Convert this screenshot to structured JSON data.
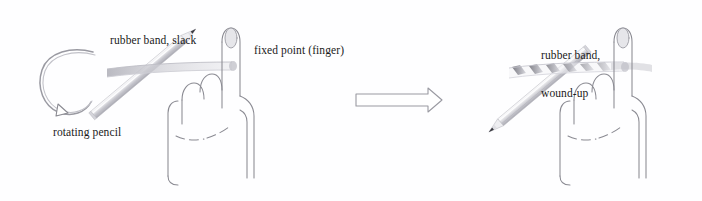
{
  "figure": {
    "background_color": "#fefeff",
    "width": 702,
    "height": 201
  },
  "panels": [
    {
      "id": "before",
      "name": "slack-state",
      "labels": {
        "band": "rubber band, slack",
        "fixed_point": "fixed point (finger)",
        "pencil": "rotating pencil"
      },
      "objects": {
        "pencil": "pencil-sharp-tip-upper-left",
        "hand": "fist-with-index-finger-extended",
        "band": "flat-untwisted-band",
        "rotation_arrow": "circular-arrow-counterclockwise"
      }
    },
    {
      "id": "after",
      "name": "wound-state",
      "labels": {
        "band_line1": "rubber band,",
        "band_line2": "wound-up"
      },
      "objects": {
        "pencil": "pencil-sharp-tip-lower-right",
        "hand": "fist-with-index-finger-extended",
        "band": "helically-twisted-band"
      }
    }
  ],
  "transition": {
    "name": "process-arrow",
    "direction": "right",
    "label": ""
  },
  "colors": {
    "ink": "#8a8a92",
    "ink_dark": "#3b3b42",
    "text": "#1a1a1a",
    "band": "#d8d8dd",
    "pencil_body": "#e2e2e6",
    "pencil_shade": "#b9b9c0",
    "nail": "#e4e4e8",
    "arrow_outline": "#9a9aa2"
  }
}
